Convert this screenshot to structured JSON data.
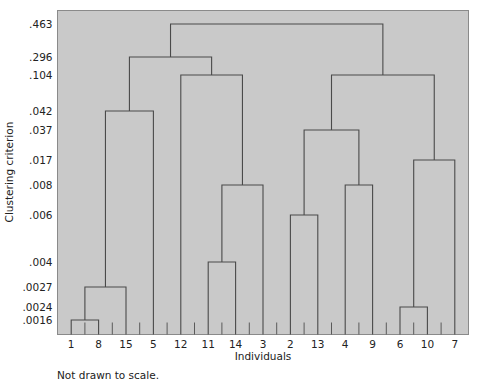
{
  "figure": {
    "note": "Not drawn to scale.",
    "plot_bg_color": "#c9c9c9",
    "line_color": "#4a4a4a",
    "frame_color": "#8a8a8a",
    "text_color": "#222222"
  },
  "chart_data": {
    "type": "dendrogram",
    "title": "",
    "xlabel": "Individuals",
    "ylabel": "Clustering criterion",
    "grid": false,
    "legend": "none",
    "note": "Not drawn to scale.",
    "leaf_order": [
      "1",
      "8",
      "15",
      "5",
      "12",
      "11",
      "14",
      "3",
      "2",
      "13",
      "4",
      "9",
      "6",
      "10",
      "7"
    ],
    "x_tick_labels": [
      "1",
      "8",
      "15",
      "5",
      "12",
      "11",
      "14",
      "3",
      "2",
      "13",
      "4",
      "9",
      "6",
      "10",
      "7"
    ],
    "y_tick_labels": [
      ".463",
      ".296",
      ".104",
      ".042",
      ".037",
      ".017",
      ".008",
      ".006",
      ".004",
      ".0027",
      ".0024",
      ".0016"
    ],
    "y_tick_values": [
      0.463,
      0.296,
      0.104,
      0.042,
      0.037,
      0.017,
      0.008,
      0.006,
      0.004,
      0.0027,
      0.0024,
      0.0016
    ],
    "y_tick_pixel_y": [
      24,
      57,
      75,
      111,
      130,
      160,
      185,
      215,
      262,
      287,
      307,
      320
    ],
    "merges": [
      {
        "id": "m1",
        "height_label": ".0016",
        "height": 0.0016,
        "members": [
          "1",
          "8"
        ],
        "children": [
          "1",
          "8"
        ]
      },
      {
        "id": "m2",
        "height_label": ".0027",
        "height": 0.0027,
        "members": [
          "1",
          "8",
          "15"
        ],
        "children": [
          "m1",
          "15"
        ]
      },
      {
        "id": "m3",
        "height_label": ".042",
        "height": 0.042,
        "members": [
          "1",
          "8",
          "15",
          "5"
        ],
        "children": [
          "m2",
          "5"
        ]
      },
      {
        "id": "m4",
        "height_label": ".004",
        "height": 0.004,
        "members": [
          "11",
          "14"
        ],
        "children": [
          "11",
          "14"
        ]
      },
      {
        "id": "m5",
        "height_label": ".008",
        "height": 0.008,
        "members": [
          "11",
          "14",
          "3"
        ],
        "children": [
          "m4",
          "3"
        ]
      },
      {
        "id": "m6",
        "height_label": ".104",
        "height": 0.104,
        "members": [
          "12",
          "11",
          "14",
          "3"
        ],
        "children": [
          "12",
          "m5"
        ]
      },
      {
        "id": "m7",
        "height_label": ".296",
        "height": 0.296,
        "members": [
          "1",
          "8",
          "15",
          "5",
          "12",
          "11",
          "14",
          "3"
        ],
        "children": [
          "m3",
          "m6"
        ]
      },
      {
        "id": "m8",
        "height_label": ".006",
        "height": 0.006,
        "members": [
          "2",
          "13"
        ],
        "children": [
          "2",
          "13"
        ]
      },
      {
        "id": "m9",
        "height_label": ".008",
        "height": 0.008,
        "members": [
          "4",
          "9"
        ],
        "children": [
          "4",
          "9"
        ]
      },
      {
        "id": "m10",
        "height_label": ".037",
        "height": 0.037,
        "members": [
          "2",
          "13",
          "4",
          "9"
        ],
        "children": [
          "m8",
          "m9"
        ]
      },
      {
        "id": "m11",
        "height_label": ".0024",
        "height": 0.0024,
        "members": [
          "6",
          "10"
        ],
        "children": [
          "6",
          "10"
        ]
      },
      {
        "id": "m12",
        "height_label": ".017",
        "height": 0.017,
        "members": [
          "6",
          "10",
          "7"
        ],
        "children": [
          "m11",
          "7"
        ]
      },
      {
        "id": "m13",
        "height_label": ".104",
        "height": 0.104,
        "members": [
          "2",
          "13",
          "4",
          "9",
          "6",
          "10",
          "7"
        ],
        "children": [
          "m10",
          "m12"
        ]
      },
      {
        "id": "m14",
        "height_label": ".463",
        "height": 0.463,
        "members": [
          "1",
          "8",
          "15",
          "5",
          "12",
          "11",
          "14",
          "3",
          "2",
          "13",
          "4",
          "9",
          "6",
          "10",
          "7"
        ],
        "children": [
          "m7",
          "m13"
        ]
      }
    ]
  }
}
